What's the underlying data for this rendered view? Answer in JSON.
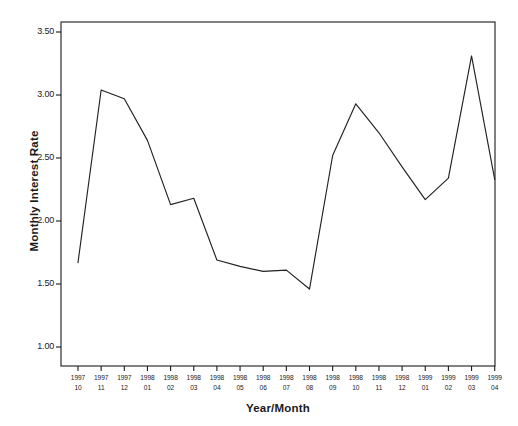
{
  "chart_data": {
    "type": "line",
    "title": "",
    "xlabel": "Year/Month",
    "ylabel": "Monthly Interest Rate",
    "ylim": [
      1.0,
      3.65
    ],
    "yticks": [
      "1.00",
      "1.50",
      "2.00",
      "2.50",
      "3.00",
      "3.50"
    ],
    "ytick_values": [
      1.0,
      1.5,
      2.0,
      2.5,
      3.0,
      3.5
    ],
    "grid": false,
    "legend": "none",
    "categories": [
      "1997 10",
      "1997 11",
      "1997 12",
      "1998 01",
      "1998 02",
      "1998 03",
      "1998 04",
      "1998 05",
      "1998 06",
      "1998 07",
      "1998 08",
      "1998 09",
      "1998 10",
      "1998 11",
      "1998 12",
      "1999 01",
      "1999 02",
      "1999 03",
      "1999 04"
    ],
    "tick_years": [
      "1997",
      "1997",
      "1997",
      "1998",
      "1998",
      "1998",
      "1998",
      "1998",
      "1998",
      "1998",
      "1998",
      "1998",
      "1998",
      "1998",
      "1998",
      "1999",
      "1999",
      "1999",
      "1999"
    ],
    "tick_months": [
      "10",
      "11",
      "12",
      "01",
      "02",
      "03",
      "04",
      "05",
      "06",
      "07",
      "08",
      "09",
      "10",
      "11",
      "12",
      "01",
      "02",
      "03",
      "04"
    ],
    "values": [
      1.67,
      3.04,
      2.97,
      2.64,
      2.13,
      2.18,
      1.69,
      1.64,
      1.6,
      1.61,
      1.46,
      2.52,
      2.93,
      2.7,
      2.43,
      2.17,
      2.34,
      3.31,
      2.33
    ],
    "series": [
      {
        "name": "Monthly Interest Rate",
        "values": [
          1.67,
          3.04,
          2.97,
          2.64,
          2.13,
          2.18,
          1.69,
          1.64,
          1.6,
          1.61,
          1.46,
          2.52,
          2.93,
          2.7,
          2.43,
          2.17,
          2.34,
          3.31,
          2.33
        ],
        "color": "#222222"
      }
    ]
  },
  "plot": {
    "line_color": "#222222",
    "frame_color": "#1a1a1a",
    "background": "#ffffff"
  }
}
